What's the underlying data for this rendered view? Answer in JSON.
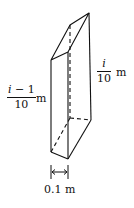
{
  "diagram": {
    "type": "prism-slice",
    "left_height": {
      "numerator_var": "i",
      "numerator_rest": " − 1",
      "denominator": "10",
      "unit": "m"
    },
    "right_height": {
      "numerator_var": "i",
      "denominator": "10",
      "unit": "m"
    },
    "width": {
      "label": "0.1 m"
    },
    "colors": {
      "stroke": "#111111",
      "background": "#ffffff"
    }
  }
}
